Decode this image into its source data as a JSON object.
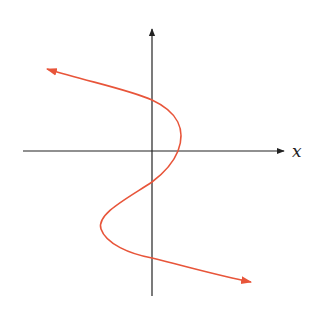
{
  "diagram": {
    "type": "curve-sketch",
    "x_axis_label": "x",
    "y_axis_label": "",
    "colors": {
      "axis": "#222222",
      "curve": "#e8553a",
      "background": "#ffffff"
    },
    "curve": {
      "start_arrow": "upper-left",
      "end_arrow": "lower-right",
      "y_axis_crossings": 3,
      "x_axis_crossings": 1,
      "x_axis_crossing_side": "positive"
    }
  }
}
